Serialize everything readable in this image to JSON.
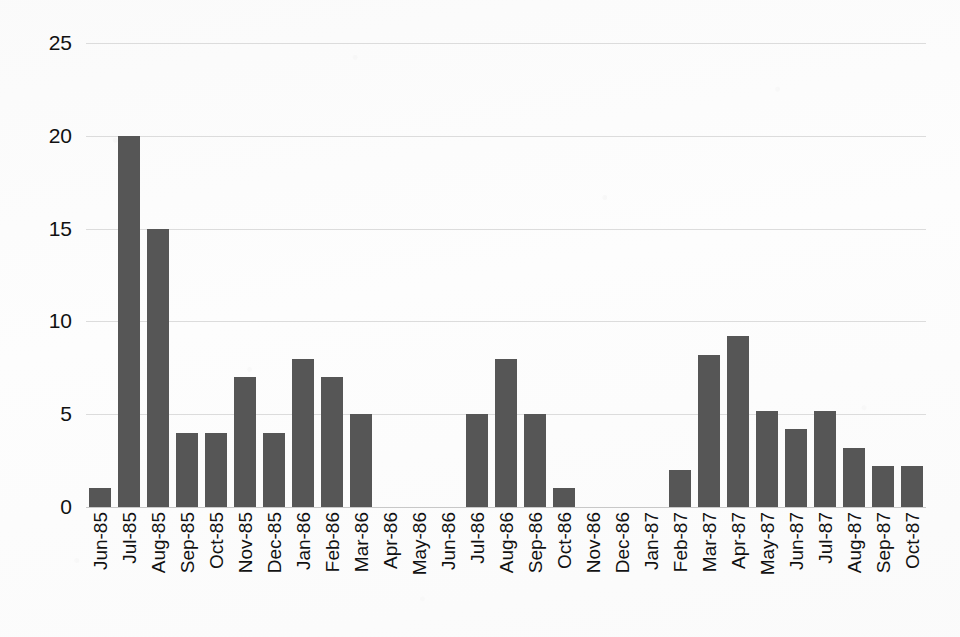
{
  "chart_data": {
    "type": "bar",
    "title": "",
    "subtitle": "",
    "xlabel": "",
    "ylabel": "",
    "ylim": [
      0,
      25
    ],
    "yticks": [
      0,
      5,
      10,
      15,
      20,
      25
    ],
    "grid": true,
    "legend": false,
    "legend_position": "none",
    "bar_color": "#565656",
    "gridline_color": "#dcdcdc",
    "background_color": "#fdfdfd",
    "categories": [
      "Jun-85",
      "Jul-85",
      "Aug-85",
      "Sep-85",
      "Oct-85",
      "Nov-85",
      "Dec-85",
      "Jan-86",
      "Feb-86",
      "Mar-86",
      "Apr-86",
      "May-86",
      "Jun-86",
      "Jul-86",
      "Aug-86",
      "Sep-86",
      "Oct-86",
      "Nov-86",
      "Dec-86",
      "Jan-87",
      "Feb-87",
      "Mar-87",
      "Apr-87",
      "May-87",
      "Jun-87",
      "Jul-87",
      "Aug-87",
      "Sep-87",
      "Oct-87"
    ],
    "values": [
      1,
      20,
      15,
      4,
      4,
      7,
      4,
      8,
      7,
      5,
      0,
      0,
      0,
      5,
      8,
      5,
      1,
      0,
      0,
      0,
      2,
      8.2,
      9.2,
      5.2,
      4.2,
      5.2,
      3.2,
      2.2,
      2.2
    ]
  }
}
